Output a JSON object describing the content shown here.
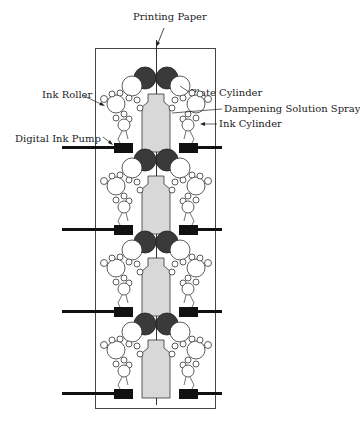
{
  "diagram": {
    "labels": {
      "printing_paper": "Printing Paper",
      "ink_roller": "Ink Roller",
      "plate_cylinder": "Plate Cylinder",
      "dampening_solution_spray": "Dampening Solution Spray",
      "ink_cylinder": "Ink Cylinder",
      "digital_ink_pump": "Digital Ink Pump"
    },
    "units": [
      {
        "index": 1,
        "offset_y": 0
      },
      {
        "index": 2,
        "offset_y": 82
      },
      {
        "index": 3,
        "offset_y": 164
      },
      {
        "index": 4,
        "offset_y": 246
      }
    ],
    "colors": {
      "line": "#222222",
      "blanket_cylinder": "#3a3a3a",
      "plate_fill": "#d8d8d8",
      "pump": "#111111"
    }
  }
}
